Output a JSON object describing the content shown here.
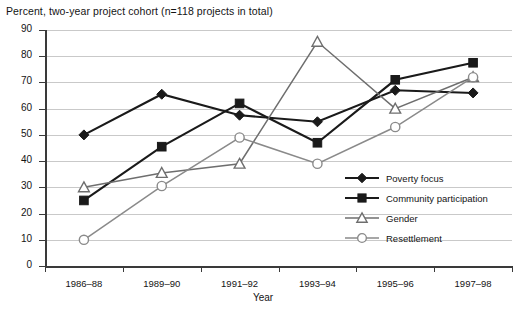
{
  "chart_data": {
    "type": "line",
    "title": "Percent, two-year project cohort (n=118 projects in total)",
    "xlabel": "Year",
    "ylabel": "",
    "ylim": [
      0,
      90
    ],
    "yticks": [
      "0",
      "10",
      "20",
      "30",
      "40",
      "50",
      "60",
      "70",
      "80",
      "90"
    ],
    "grid": true,
    "legend_position": "inside-bottom-right",
    "categories": [
      "1986–88",
      "1989–90",
      "1991–92",
      "1993–94",
      "1995–96",
      "1997–98"
    ],
    "series": [
      {
        "name": "Poverty focus",
        "marker": "filled-diamond",
        "color": "#1a1a1a",
        "values": [
          50,
          65.5,
          57.5,
          55,
          67,
          66
        ]
      },
      {
        "name": "Community participation",
        "marker": "filled-square",
        "color": "#1a1a1a",
        "values": [
          25,
          45.5,
          62,
          47,
          71,
          77.5
        ]
      },
      {
        "name": "Gender",
        "marker": "open-triangle",
        "color": "#6e6e6e",
        "values": [
          30,
          35.5,
          39,
          85.5,
          60,
          72
        ]
      },
      {
        "name": "Resettlement",
        "marker": "open-circle",
        "color": "#8a8a8a",
        "values": [
          10,
          30.5,
          49,
          39,
          53,
          72
        ]
      }
    ]
  },
  "legend": {
    "entries": [
      {
        "label": "Poverty focus"
      },
      {
        "label": "Community participation"
      },
      {
        "label": "Gender"
      },
      {
        "label": "Resettlement"
      }
    ]
  }
}
